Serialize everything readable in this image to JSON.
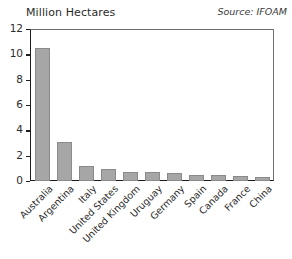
{
  "chart_data": {
    "type": "bar",
    "title": "",
    "ylabel": "Million Hectares",
    "xlabel": "",
    "annotation": "Source: IFOAM",
    "grid": false,
    "legend": "none",
    "ylim": [
      0,
      12
    ],
    "yticks": [
      0,
      2,
      4,
      6,
      8,
      10,
      12
    ],
    "ytick_labels": [
      "0",
      "2",
      "4",
      "6",
      "8",
      "10",
      "12"
    ],
    "categories": [
      "Australia",
      "Argentina",
      "Italy",
      "United States",
      "United Kingdom",
      "Uruguay",
      "Germany",
      "Spain",
      "Canada",
      "France",
      "China"
    ],
    "values": [
      10.5,
      3.1,
      1.2,
      0.95,
      0.68,
      0.68,
      0.63,
      0.5,
      0.45,
      0.42,
      0.3
    ],
    "bar_color": "#a6a6a6",
    "bar_edge_color": "#8a8a8a",
    "axis_color": "#1d1d1d"
  }
}
